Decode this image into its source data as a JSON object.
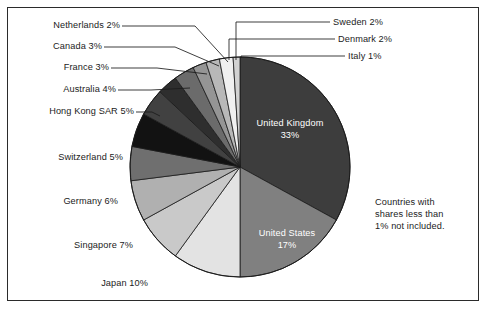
{
  "figure": {
    "background_color": "#ffffff",
    "border_color": "#2b2b2b",
    "note": "Countries with shares less than 1% not included."
  },
  "note_lines": {
    "line1": "Countries with",
    "line2": "shares less than",
    "line3": "1% not included."
  },
  "chart_data": {
    "type": "pie",
    "title": "",
    "subtitle": "",
    "xlabel": "",
    "ylabel": "",
    "legend_position": "none",
    "grid": false,
    "units": "percent",
    "start_angle_deg": 90,
    "direction": "clockwise",
    "annotations": [
      "Countries with shares less than 1% not included."
    ],
    "labels": [
      "United Kingdom",
      "United States",
      "Japan",
      "Singapore",
      "Germany",
      "Switzerland",
      "Hong Kong SAR",
      "Australia",
      "France",
      "Canada",
      "Netherlands",
      "Sweden",
      "Denmark",
      "Italy"
    ],
    "values": [
      33,
      17,
      10,
      7,
      6,
      5,
      5,
      4,
      3,
      3,
      2,
      2,
      2,
      1
    ],
    "colors": [
      "#3d3d3d",
      "#808080",
      "#e3e3e3",
      "#c9c9c9",
      "#b0b0b0",
      "#6f6f6f",
      "#121212",
      "#414141",
      "#2e2e2e",
      "#6b6b6b",
      "#959595",
      "#b8b8b8",
      "#f0f0f0",
      "#d2d2d2"
    ],
    "slices": [
      {
        "label": "United Kingdom",
        "value": 33,
        "text": "United Kingdom",
        "pct_text": "33%",
        "color": "#3d3d3d",
        "label_placement": "inside",
        "label_color": "#ffffff"
      },
      {
        "label": "United States",
        "value": 17,
        "text": "United States",
        "pct_text": "17%",
        "color": "#808080",
        "label_placement": "inside",
        "label_color": "#ffffff"
      },
      {
        "label": "Japan",
        "value": 10,
        "text": "Japan 10%",
        "pct_text": "10%",
        "color": "#e3e3e3",
        "label_placement": "outside",
        "leader": false
      },
      {
        "label": "Singapore",
        "value": 7,
        "text": "Singapore 7%",
        "pct_text": "7%",
        "color": "#c9c9c9",
        "label_placement": "outside",
        "leader": false
      },
      {
        "label": "Germany",
        "value": 6,
        "text": "Germany 6%",
        "pct_text": "6%",
        "color": "#b0b0b0",
        "label_placement": "outside",
        "leader": false
      },
      {
        "label": "Switzerland",
        "value": 5,
        "text": "Switzerland 5%",
        "pct_text": "5%",
        "color": "#6f6f6f",
        "label_placement": "outside",
        "leader": false
      },
      {
        "label": "Hong Kong SAR",
        "value": 5,
        "text": "Hong Kong SAR 5%",
        "pct_text": "5%",
        "color": "#121212",
        "label_placement": "outside",
        "leader": true
      },
      {
        "label": "Australia",
        "value": 4,
        "text": "Australia 4%",
        "pct_text": "4%",
        "color": "#414141",
        "label_placement": "outside",
        "leader": true
      },
      {
        "label": "France",
        "value": 3,
        "text": "France 3%",
        "pct_text": "3%",
        "color": "#2e2e2e",
        "label_placement": "outside",
        "leader": true
      },
      {
        "label": "Canada",
        "value": 3,
        "text": "Canada 3%",
        "pct_text": "3%",
        "color": "#6b6b6b",
        "label_placement": "outside",
        "leader": true
      },
      {
        "label": "Netherlands",
        "value": 2,
        "text": "Netherlands 2%",
        "pct_text": "2%",
        "color": "#959595",
        "label_placement": "outside",
        "leader": true
      },
      {
        "label": "Sweden",
        "value": 2,
        "text": "Sweden 2%",
        "pct_text": "2%",
        "color": "#b8b8b8",
        "label_placement": "outside",
        "leader": true
      },
      {
        "label": "Denmark",
        "value": 2,
        "text": "Denmark 2%",
        "pct_text": "2%",
        "color": "#f0f0f0",
        "label_placement": "outside",
        "leader": true
      },
      {
        "label": "Italy",
        "value": 1,
        "text": "Italy 1%",
        "pct_text": "1%",
        "color": "#d2d2d2",
        "label_placement": "outside",
        "leader": true
      }
    ]
  },
  "callouts": {
    "netherlands": "Netherlands 2%",
    "canada": "Canada 3%",
    "france": "France 3%",
    "australia": "Australia 4%",
    "hong_kong": "Hong Kong SAR 5%",
    "switzerland": "Switzerland 5%",
    "germany": "Germany 6%",
    "singapore": "Singapore 7%",
    "japan": "Japan 10%",
    "sweden": "Sweden 2%",
    "denmark": "Denmark 2%",
    "italy": "Italy 1%"
  },
  "inside_labels": {
    "uk_name": "United Kingdom",
    "uk_pct": "33%",
    "us_name": "United States",
    "us_pct": "17%"
  }
}
